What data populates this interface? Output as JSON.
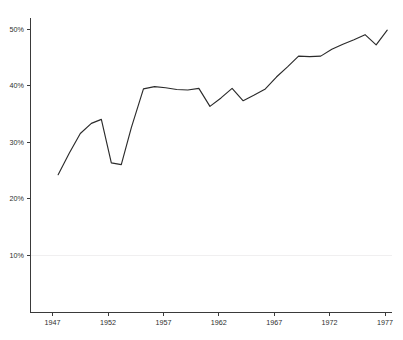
{
  "chart_data": {
    "type": "line",
    "title": "",
    "subtitle": "",
    "xlabel": "",
    "ylabel": "",
    "xlim": [
      1946.0,
      1978.2
    ],
    "ylim": [
      0.0,
      52.0
    ],
    "grid": "horizontal-faint-at-10-only",
    "legend": "none",
    "line_color": "#2b2b2b",
    "axis_color": "#3a3a3a",
    "gridline_color": "#f0eff0",
    "y_tick_labels": [
      "10%",
      "20%",
      "30%",
      "40%",
      "50%"
    ],
    "y_tick_values": [
      10,
      20,
      30,
      40,
      50
    ],
    "x_tick_labels": [
      "1947",
      "1952",
      "1957",
      "1962",
      "1967",
      "1972",
      "1977"
    ],
    "x_tick_values": [
      1947,
      1952,
      1957,
      1962,
      1967,
      1972,
      1977
    ],
    "x": [
      1947.5,
      1948.5,
      1949.5,
      1950.5,
      1951.4,
      1952.3,
      1953.2,
      1954.1,
      1955.2,
      1956.2,
      1957.2,
      1958.2,
      1959.2,
      1960.2,
      1961.2,
      1962.2,
      1963.2,
      1964.2,
      1965.2,
      1966.2,
      1967.2,
      1968.2,
      1969.2,
      1970.2,
      1971.2,
      1972.2,
      1973.2,
      1974.2,
      1975.2,
      1976.2,
      1977.2
    ],
    "values": [
      24.2,
      28.0,
      31.5,
      33.3,
      34.0,
      26.3,
      26.0,
      32.5,
      39.4,
      39.8,
      39.6,
      39.3,
      39.2,
      39.5,
      36.3,
      37.8,
      39.5,
      37.3,
      38.3,
      39.4,
      41.5,
      43.3,
      45.2,
      45.1,
      45.2,
      46.4,
      47.3,
      48.1,
      49.0,
      47.2,
      49.8
    ],
    "series": [
      {
        "name": "series-1",
        "values": [
          24.2,
          28.0,
          31.5,
          33.3,
          34.0,
          26.3,
          26.0,
          32.5,
          39.4,
          39.8,
          39.6,
          39.3,
          39.2,
          39.5,
          36.3,
          37.8,
          39.5,
          37.3,
          38.3,
          39.4,
          41.5,
          43.3,
          45.2,
          45.1,
          45.2,
          46.4,
          47.3,
          48.1,
          49.0,
          47.2,
          49.8
        ]
      }
    ]
  }
}
